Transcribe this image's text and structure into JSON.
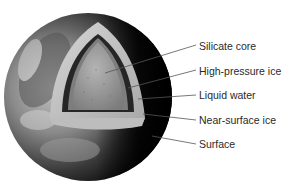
{
  "diagram": {
    "type": "cutaway-sphere",
    "colors": {
      "background": "#ffffff",
      "label_text": "#2a2a2a",
      "leader_line": "#555555",
      "surface_light": "#b8b8b8",
      "surface_dark": "#0c0c0c",
      "near_surface_ice": "#c9c9c9",
      "liquid_water": "#2b2b2b",
      "high_pressure_ice": "#8f8f8f",
      "silicate_core": "#a4a4a4"
    },
    "labels": [
      {
        "id": "silicate-core",
        "text": "Silicate core"
      },
      {
        "id": "high-pressure-ice",
        "text": "High-pressure ice"
      },
      {
        "id": "liquid-water",
        "text": "Liquid water"
      },
      {
        "id": "near-surface-ice",
        "text": "Near-surface ice"
      },
      {
        "id": "surface",
        "text": "Surface"
      }
    ]
  }
}
